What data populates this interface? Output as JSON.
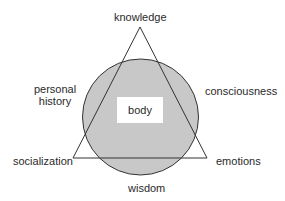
{
  "diagram": {
    "shapes": {
      "circle": {
        "cx": 140.5,
        "cy": 117,
        "r": 58,
        "fill": "#c8c8c8",
        "stroke": "#333333"
      },
      "triangle": {
        "points": "140,27 73,158 207,158",
        "stroke": "#333333"
      }
    },
    "center_label": "body",
    "labels": {
      "top": "knowledge",
      "upper_left_line1": "personal",
      "upper_left_line2": "history",
      "upper_right": "consciousness",
      "lower_left": "socialization",
      "lower_right": "emotions",
      "bottom": "wisdom"
    },
    "colors": {
      "circle_fill": "#c8c8c8",
      "line": "#333333",
      "text": "#2a2a2a",
      "background": "#ffffff"
    }
  }
}
